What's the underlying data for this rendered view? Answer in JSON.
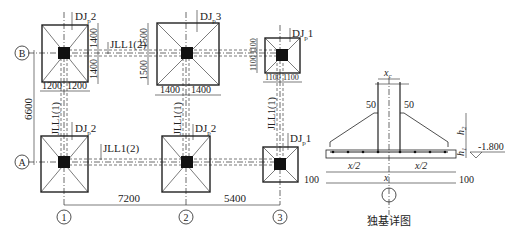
{
  "drawing": {
    "type": "foundation plan with isolated footing detail",
    "axes": {
      "horizontal": [
        {
          "label": "1"
        },
        {
          "label": "2"
        },
        {
          "label": "3"
        }
      ],
      "vertical": [
        {
          "label": "B"
        },
        {
          "label": "A"
        }
      ]
    },
    "spans": {
      "span_1_2": "7200",
      "span_2_3": "5400",
      "span_A_B": "6600"
    },
    "footings": [
      {
        "id": "B1",
        "label": "DJp2",
        "dims": [
          "1200",
          "1200",
          "1400",
          "1400"
        ]
      },
      {
        "id": "B2",
        "label": "DJp3",
        "dims": [
          "1400",
          "1400",
          "1500",
          "1500"
        ]
      },
      {
        "id": "B3",
        "label": "DJp1",
        "dims": [
          "1100",
          "1100",
          "1100",
          "1100"
        ]
      },
      {
        "id": "A1",
        "label": "DJp2"
      },
      {
        "id": "A2",
        "label": "DJp2"
      },
      {
        "id": "A3",
        "label": "DJp1"
      }
    ],
    "beams": {
      "horizontal_top": "JLL1(2)",
      "horizontal_bottom": "JLL1(2)",
      "vertical_1": "JLL1(1)",
      "vertical_2": "JLL1(1)",
      "vertical_3": "JLL1(1)"
    },
    "labels": {
      "dj": "DJ",
      "p": "p",
      "dj2": "2",
      "dj3": "3",
      "dj1": "1"
    },
    "detail": {
      "title": "独基详图",
      "col_width": "x",
      "col_sub": "c",
      "cover_left": "50",
      "cover_right": "50",
      "h": "h",
      "h2_sub": "2",
      "h1_sub": "1",
      "elevation": "-1.800",
      "half_left": "x/2",
      "half_right": "x/2",
      "full": "x",
      "pad_left": "100",
      "pad_right": "100"
    }
  }
}
